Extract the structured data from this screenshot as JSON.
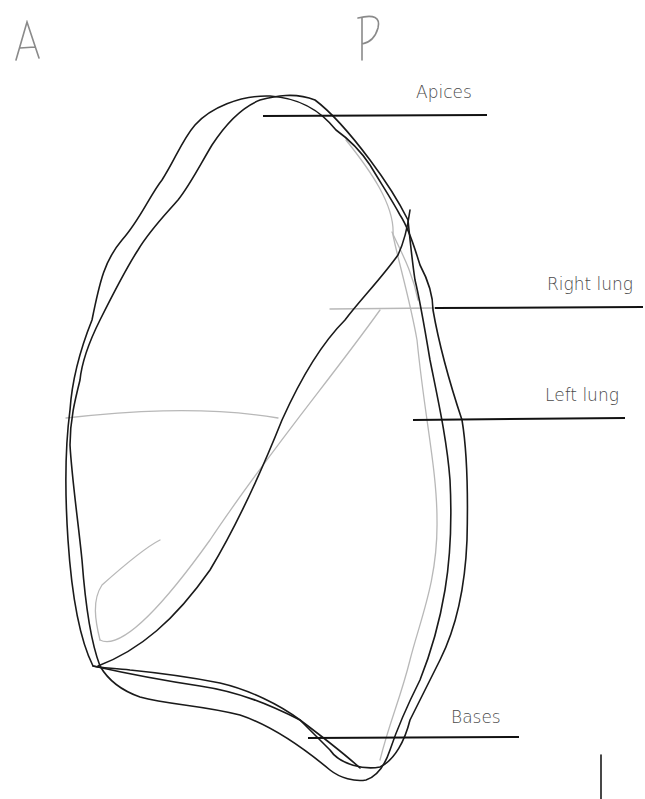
{
  "orientation": {
    "anterior": "A",
    "posterior": "P"
  },
  "labels": {
    "apices": "Apices",
    "right_lung": "Right lung",
    "left_lung": "Left lung",
    "bases": "Bases"
  },
  "colors": {
    "outline_dark": "#1a1a1a",
    "outline_light": "#b8b8b8",
    "leader_line": "#111111",
    "label_text": "#4a4a4a",
    "orientation_text": "#8a8a8a"
  }
}
